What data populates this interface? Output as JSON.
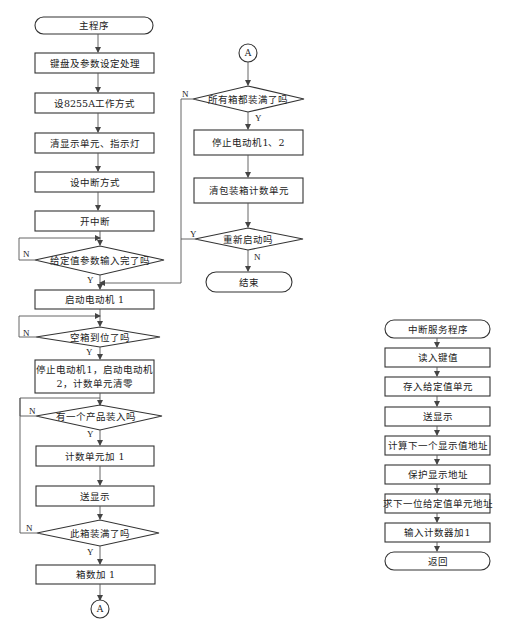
{
  "main_program": {
    "start": "主程序",
    "steps": [
      "键盘及参数设定处理",
      "设8255A工作方式",
      "清显示单元、指示灯",
      "设中断方式",
      "开中断"
    ],
    "decision_params": "给定值参数输入完了吗",
    "start_motor1": "启动电动机 1",
    "decision_empty_box": "空箱到位了吗",
    "stop_start_line1": "停止电动机1，启动电动机",
    "stop_start_line2": "2，计数单元清零",
    "decision_product": "有一个产品装入吗",
    "count_inc": "计数单元加 1",
    "show": "送显示",
    "decision_box_full": "此箱装满了吗",
    "box_count_inc": "箱数加 1",
    "connector": "A"
  },
  "continuation": {
    "connector": "A",
    "decision_all_full": "所有箱都装满了吗",
    "stop_motors": "停止电动机1、2",
    "clear_counter": "清包装箱计数单元",
    "decision_restart": "重新启动吗",
    "end": "结束"
  },
  "interrupt_routine": {
    "start": "中断服务程序",
    "steps": [
      "读入键值",
      "存入给定值单元",
      "送显示",
      "计算下一个显示值地址",
      "保护显示地址",
      "求下一位给定值单元地址",
      "输入计数器加1"
    ],
    "end": "返回"
  },
  "branch_labels": {
    "yes": "Y",
    "no": "N"
  }
}
